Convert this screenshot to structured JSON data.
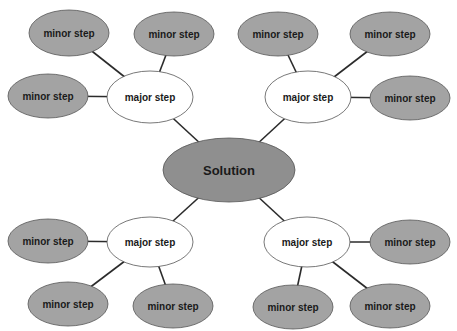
{
  "colors": {
    "root_fill": "#8f8f8f",
    "minor_fill": "#a3a3a3",
    "major_fill": "#ffffff",
    "stroke": "#555555",
    "edge": "#2b2b2b"
  },
  "root": {
    "label": "Solution",
    "cx": 229,
    "cy": 170,
    "rx": 66,
    "ry": 32
  },
  "branches": [
    {
      "major": {
        "label": "major step",
        "cx": 150,
        "cy": 97,
        "rx": 43,
        "ry": 26
      },
      "minors": [
        {
          "label": "minor step",
          "cx": 69,
          "cy": 33,
          "rx": 40,
          "ry": 23
        },
        {
          "label": "minor step",
          "cx": 174,
          "cy": 34,
          "rx": 40,
          "ry": 22
        },
        {
          "label": "minor step",
          "cx": 48,
          "cy": 96,
          "rx": 40,
          "ry": 22
        }
      ]
    },
    {
      "major": {
        "label": "major step",
        "cx": 308,
        "cy": 97,
        "rx": 43,
        "ry": 26
      },
      "minors": [
        {
          "label": "minor step",
          "cx": 278,
          "cy": 34,
          "rx": 40,
          "ry": 22
        },
        {
          "label": "minor step",
          "cx": 390,
          "cy": 34,
          "rx": 40,
          "ry": 22
        },
        {
          "label": "minor step",
          "cx": 410,
          "cy": 98,
          "rx": 40,
          "ry": 22
        }
      ]
    },
    {
      "major": {
        "label": "major step",
        "cx": 150,
        "cy": 242,
        "rx": 43,
        "ry": 25
      },
      "minors": [
        {
          "label": "minor step",
          "cx": 48,
          "cy": 241,
          "rx": 40,
          "ry": 22
        },
        {
          "label": "minor step",
          "cx": 68,
          "cy": 304,
          "rx": 40,
          "ry": 22
        },
        {
          "label": "minor step",
          "cx": 173,
          "cy": 306,
          "rx": 40,
          "ry": 22
        }
      ]
    },
    {
      "major": {
        "label": "major step",
        "cx": 307,
        "cy": 242,
        "rx": 43,
        "ry": 25
      },
      "minors": [
        {
          "label": "minor step",
          "cx": 410,
          "cy": 242,
          "rx": 40,
          "ry": 22
        },
        {
          "label": "minor step",
          "cx": 293,
          "cy": 307,
          "rx": 40,
          "ry": 22
        },
        {
          "label": "minor step",
          "cx": 390,
          "cy": 306,
          "rx": 40,
          "ry": 22
        }
      ]
    }
  ]
}
